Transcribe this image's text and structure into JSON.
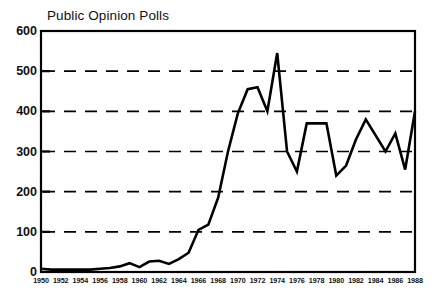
{
  "chart_data": {
    "type": "line",
    "title": "Public Opinion Polls",
    "xlabel": "",
    "ylabel": "",
    "xlim": [
      1950,
      1988
    ],
    "ylim": [
      0,
      600
    ],
    "grid": true,
    "grid_style": "dashed-horizontal",
    "legend": "none",
    "line_color": "#000000",
    "frame_color": "#000000",
    "background_color": "#ffffff",
    "y_ticks": [
      0,
      100,
      200,
      300,
      400,
      500,
      600
    ],
    "y_tick_labels": [
      "0",
      "100",
      "200",
      "300",
      "400",
      "500",
      "600"
    ],
    "x_ticks": [
      1950,
      1952,
      1954,
      1956,
      1958,
      1960,
      1962,
      1964,
      1966,
      1968,
      1970,
      1972,
      1974,
      1976,
      1978,
      1980,
      1982,
      1984,
      1986,
      1988
    ],
    "x_tick_labels": [
      "1950",
      "1952",
      "1954",
      "1956",
      "1958",
      "1960",
      "1962",
      "1964",
      "1966",
      "1968",
      "1970",
      "1972",
      "1974",
      "1976",
      "1978",
      "1980",
      "1982",
      "1984",
      "1986",
      "1988"
    ],
    "x": [
      1950,
      1951,
      1952,
      1953,
      1954,
      1955,
      1956,
      1957,
      1958,
      1959,
      1960,
      1961,
      1962,
      1963,
      1964,
      1965,
      1966,
      1967,
      1968,
      1969,
      1970,
      1971,
      1972,
      1973,
      1974,
      1975,
      1976,
      1977,
      1978,
      1979,
      1980,
      1981,
      1982,
      1983,
      1984,
      1985,
      1986,
      1987,
      1988
    ],
    "values": [
      8,
      6,
      6,
      6,
      6,
      6,
      8,
      10,
      14,
      22,
      12,
      26,
      28,
      20,
      32,
      48,
      105,
      118,
      185,
      300,
      395,
      455,
      460,
      400,
      545,
      300,
      250,
      370,
      370,
      370,
      240,
      265,
      330,
      380,
      340,
      300,
      345,
      255,
      400
    ],
    "series": [
      {
        "name": "Public Opinion Polls",
        "values": [
          8,
          6,
          6,
          6,
          6,
          6,
          8,
          10,
          14,
          22,
          12,
          26,
          28,
          20,
          32,
          48,
          105,
          118,
          185,
          300,
          395,
          455,
          460,
          400,
          545,
          300,
          250,
          370,
          370,
          370,
          240,
          265,
          330,
          380,
          340,
          300,
          345,
          255,
          400
        ]
      }
    ]
  }
}
